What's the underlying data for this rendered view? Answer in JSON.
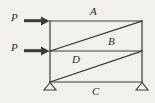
{
  "figure": {
    "kind": "structural-frame-diagram",
    "background_color": "#f2f0ed",
    "line_color": "#3a3a3a",
    "label_color": "#2b2b2b",
    "labels": {
      "top_chord": "A",
      "upper_diagonal": "B",
      "lower_diagonal": "D",
      "bottom_chord": "C",
      "load_top": "P",
      "load_middle": "P"
    },
    "geometry": {
      "left_x": 50,
      "right_x": 142,
      "top_y": 21,
      "middle_y": 51,
      "bottom_y": 82,
      "arrow_tail_x": 24,
      "arrow_head_x": 49,
      "support_half_width": 6,
      "support_height": 7
    },
    "members": [
      {
        "name": "top-chord",
        "from": [
          50,
          21
        ],
        "to": [
          142,
          21
        ]
      },
      {
        "name": "left-column",
        "from": [
          50,
          21
        ],
        "to": [
          50,
          82
        ]
      },
      {
        "name": "right-column",
        "from": [
          142,
          21
        ],
        "to": [
          142,
          82
        ]
      },
      {
        "name": "middle-beam",
        "from": [
          50,
          51
        ],
        "to": [
          142,
          51
        ]
      },
      {
        "name": "bottom-chord",
        "from": [
          50,
          82
        ],
        "to": [
          142,
          82
        ]
      },
      {
        "name": "upper-diagonal-B",
        "from": [
          50,
          51
        ],
        "to": [
          142,
          21
        ]
      },
      {
        "name": "lower-diagonal-D",
        "from": [
          50,
          82
        ],
        "to": [
          142,
          51
        ]
      }
    ],
    "loads": [
      {
        "name": "load-arrow-top",
        "label": "P",
        "y": 21,
        "direction": "right"
      },
      {
        "name": "load-arrow-middle",
        "label": "P",
        "y": 51,
        "direction": "right"
      }
    ],
    "supports": [
      {
        "name": "pin-support-left",
        "x": 50,
        "y": 82,
        "type": "pin"
      },
      {
        "name": "pin-support-right",
        "x": 142,
        "y": 82,
        "type": "pin"
      }
    ]
  }
}
